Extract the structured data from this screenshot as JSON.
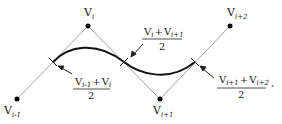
{
  "diagram": {
    "type": "spline-midpoint-construction",
    "vertices": [
      {
        "id": "v_im1",
        "label": "V",
        "subscript": "i-1",
        "x": 17,
        "y": 99
      },
      {
        "id": "v_i",
        "label": "V",
        "subscript": "i",
        "x": 88,
        "y": 26
      },
      {
        "id": "v_ip1",
        "label": "V",
        "subscript": "i+1",
        "x": 160,
        "y": 99
      },
      {
        "id": "v_ip2",
        "label": "V",
        "subscript": "i+2",
        "x": 230,
        "y": 26
      }
    ],
    "midpoint_labels": [
      {
        "num_a": "V",
        "num_a_sub": "i-1",
        "plus": "+",
        "num_b": "V",
        "num_b_sub": "i",
        "den": "2"
      },
      {
        "num_a": "V",
        "num_a_sub": "i",
        "plus": "+",
        "num_b": "V",
        "num_b_sub": "i+1",
        "den": "2"
      },
      {
        "num_a": "V",
        "num_a_sub": "i+1",
        "plus": "+",
        "num_b": "V",
        "num_b_sub": "i+2",
        "den": "2"
      }
    ],
    "trailing_punct": ",",
    "colors": {
      "polyline": "#a0a0a0",
      "curve": "#111111",
      "vertex": "#000000",
      "text": "#222222"
    }
  }
}
